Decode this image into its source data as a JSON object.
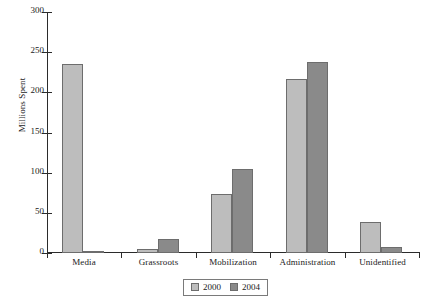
{
  "chart_data": {
    "type": "bar",
    "title": "",
    "xlabel": "",
    "ylabel": "Millions Spent",
    "categories": [
      "Media",
      "Grassroots",
      "Mobilization",
      "Administration",
      "Unidentified"
    ],
    "series": [
      {
        "name": "2000",
        "color": "#bdbdbd",
        "values": [
          235,
          5,
          74,
          216,
          38
        ]
      },
      {
        "name": "2004",
        "color": "#8a8a8a",
        "values": [
          3,
          17,
          105,
          238,
          8
        ]
      }
    ],
    "ylim": [
      0,
      300
    ],
    "yticks": [
      0,
      50,
      100,
      150,
      200,
      250,
      300
    ],
    "ytick_labels": [
      "0",
      "50",
      "100",
      "150",
      "200",
      "250",
      "300"
    ],
    "grid": false,
    "legend_position": "bottom-center",
    "legend_entries": [
      "2000",
      "2004"
    ]
  },
  "colors": {
    "series_2000": "#bdbdbd",
    "series_2004": "#8a8a8a",
    "axis": "#2b2b2b",
    "bar_edge": "#6d6d6d",
    "background": "#ffffff"
  }
}
